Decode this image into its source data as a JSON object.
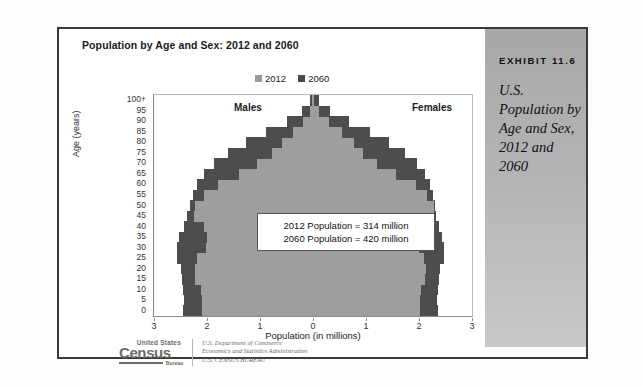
{
  "exhibit": {
    "number": "EXHIBIT 11.6",
    "caption": "U.S. Population by Age and Sex, 2012 and 2060"
  },
  "chart_title": "Population by Age and Sex: 2012 and 2060",
  "legend": [
    {
      "label": "2012",
      "color": "#9a9a9a"
    },
    {
      "label": "2060",
      "color": "#4a4a4a"
    }
  ],
  "sex_labels": {
    "left": "Males",
    "right": "Females"
  },
  "annotation": {
    "line1": "2012 Population = 314 million",
    "line2": "2060 Population = 420 million"
  },
  "source": {
    "logo_top": "United States",
    "logo_main": "Census",
    "logo_bureau": "Bureau",
    "line1": "U.S. Department of Commerce",
    "line2": "Economics and Statistics Administration",
    "line3": "U.S. CENSUS BUREAU"
  },
  "chart_data": {
    "type": "bar",
    "subtype": "population-pyramid",
    "title": "Population by Age and Sex: 2012 and 2060",
    "xlabel": "Population (in millions)",
    "ylabel": "Age (years)",
    "xlim": [
      -3,
      3
    ],
    "xticks": [
      3,
      2,
      1,
      0,
      1,
      2,
      3
    ],
    "grid": false,
    "legend_position": "top-center",
    "categories": [
      "0",
      "5",
      "10",
      "15",
      "20",
      "25",
      "30",
      "35",
      "40",
      "45",
      "50",
      "55",
      "60",
      "65",
      "70",
      "75",
      "80",
      "85",
      "90",
      "95",
      "100+"
    ],
    "series": [
      {
        "name": "2012",
        "sex": "Males",
        "values": [
          2.1,
          2.1,
          2.12,
          2.22,
          2.23,
          2.18,
          2.02,
          2.0,
          2.06,
          2.25,
          2.22,
          2.05,
          1.8,
          1.4,
          1.05,
          0.78,
          0.58,
          0.37,
          0.18,
          0.06,
          0.01
        ]
      },
      {
        "name": "2012",
        "sex": "Females",
        "values": [
          2.01,
          2.01,
          2.03,
          2.12,
          2.13,
          2.1,
          2.0,
          1.99,
          2.07,
          2.28,
          2.29,
          2.16,
          1.95,
          1.56,
          1.21,
          0.95,
          0.77,
          0.55,
          0.31,
          0.12,
          0.02
        ]
      },
      {
        "name": "2060",
        "sex": "Males",
        "values": [
          2.45,
          2.44,
          2.45,
          2.47,
          2.5,
          2.57,
          2.57,
          2.52,
          2.44,
          2.38,
          2.33,
          2.27,
          2.18,
          2.06,
          1.86,
          1.6,
          1.26,
          0.88,
          0.5,
          0.21,
          0.06
        ]
      },
      {
        "name": "2060",
        "sex": "Females",
        "values": [
          2.35,
          2.34,
          2.35,
          2.37,
          2.4,
          2.47,
          2.48,
          2.44,
          2.38,
          2.33,
          2.3,
          2.26,
          2.2,
          2.12,
          1.96,
          1.74,
          1.43,
          1.07,
          0.68,
          0.32,
          0.11
        ]
      }
    ],
    "annotations": [
      "2012 Population = 314 million",
      "2060 Population = 420 million"
    ]
  }
}
